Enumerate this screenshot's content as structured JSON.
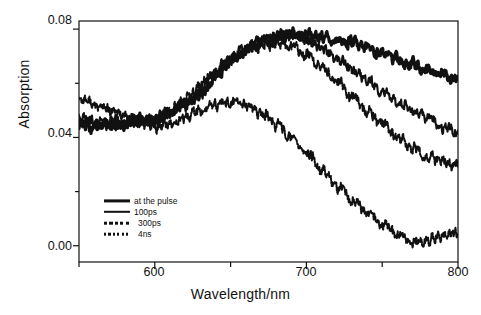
{
  "figure": {
    "background": "#ffffff",
    "ink": "#111111"
  },
  "axes": {
    "xlabel": "Wavelength/nm",
    "ylabel": "Absorption",
    "x_ticks_major": [
      "600",
      "700",
      "800"
    ],
    "x_ticks_major_values": [
      600,
      700,
      800
    ],
    "x_ticks_minor_values": [
      550,
      650,
      750
    ],
    "y_ticks_major": [
      "0.08",
      "0.04",
      "0.00"
    ],
    "y_ticks_major_values": [
      0.08,
      0.04,
      0.0
    ],
    "y_ticks_minor_values": [
      0.06,
      0.02
    ]
  },
  "legend": {
    "entries": [
      {
        "label": "at the pulse",
        "style": "thick-solid"
      },
      {
        "label": "100ps",
        "style": "solid"
      },
      {
        "label": "300ps",
        "style": "dashed"
      },
      {
        "label": "4ns",
        "style": "dotted"
      }
    ]
  },
  "chart_data": {
    "type": "line",
    "title": "",
    "xlabel": "Wavelength/nm",
    "ylabel": "Absorption",
    "xlim": [
      550,
      800
    ],
    "ylim": [
      -0.006,
      0.083
    ],
    "grid": false,
    "legend_position": "lower-left-inside",
    "noise": "high-frequency spectral noise on all traces",
    "x": [
      550,
      560,
      570,
      580,
      590,
      600,
      610,
      620,
      630,
      640,
      650,
      660,
      670,
      680,
      690,
      700,
      710,
      720,
      730,
      740,
      750,
      760,
      770,
      780,
      790,
      800
    ],
    "series": [
      {
        "name": "at the pulse",
        "style": "thick-solid",
        "values": [
          0.045,
          0.044,
          0.046,
          0.045,
          0.047,
          0.046,
          0.049,
          0.052,
          0.056,
          0.062,
          0.068,
          0.072,
          0.075,
          0.077,
          0.078,
          0.078,
          0.077,
          0.076,
          0.075,
          0.073,
          0.071,
          0.069,
          0.067,
          0.065,
          0.063,
          0.062
        ]
      },
      {
        "name": "100ps",
        "style": "solid",
        "values": [
          0.046,
          0.045,
          0.044,
          0.045,
          0.046,
          0.047,
          0.049,
          0.052,
          0.057,
          0.063,
          0.069,
          0.073,
          0.076,
          0.077,
          0.078,
          0.076,
          0.073,
          0.069,
          0.065,
          0.061,
          0.057,
          0.053,
          0.05,
          0.047,
          0.044,
          0.042
        ]
      },
      {
        "name": "300ps",
        "style": "dashed",
        "values": [
          0.047,
          0.046,
          0.045,
          0.045,
          0.046,
          0.047,
          0.05,
          0.054,
          0.059,
          0.064,
          0.069,
          0.072,
          0.074,
          0.075,
          0.074,
          0.071,
          0.066,
          0.061,
          0.055,
          0.05,
          0.045,
          0.04,
          0.036,
          0.033,
          0.031,
          0.03
        ]
      },
      {
        "name": "4ns",
        "style": "dotted",
        "values": [
          0.055,
          0.052,
          0.05,
          0.048,
          0.046,
          0.044,
          0.045,
          0.047,
          0.05,
          0.052,
          0.053,
          0.052,
          0.049,
          0.045,
          0.04,
          0.034,
          0.028,
          0.022,
          0.017,
          0.012,
          0.008,
          0.004,
          0.001,
          0.002,
          0.004,
          0.005
        ]
      }
    ]
  }
}
